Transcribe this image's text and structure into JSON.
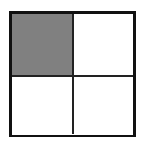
{
  "diagram": {
    "type": "2x2 grid",
    "rows": 2,
    "cols": 2,
    "cells": [
      {
        "row": 0,
        "col": 0,
        "fill": "#808080",
        "shaded": true
      },
      {
        "row": 0,
        "col": 1,
        "fill": "#ffffff",
        "shaded": false
      },
      {
        "row": 1,
        "col": 0,
        "fill": "#ffffff",
        "shaded": false
      },
      {
        "row": 1,
        "col": 1,
        "fill": "#ffffff",
        "shaded": false
      }
    ],
    "border_color": "#111111",
    "shaded_fraction": "1/4"
  }
}
